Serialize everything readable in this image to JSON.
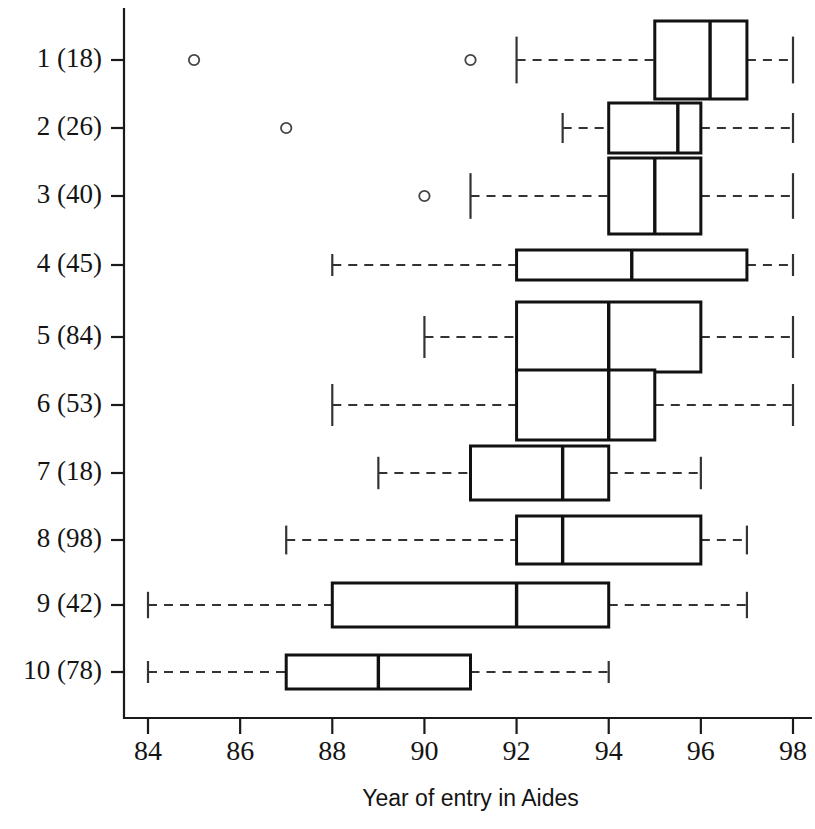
{
  "chart_data": {
    "type": "boxplot",
    "title": "",
    "xlabel": "Year of entry in Aides",
    "ylabel": "",
    "xlim": [
      83.3,
      98.6
    ],
    "xticks": [
      84,
      86,
      88,
      90,
      92,
      94,
      96,
      98
    ],
    "xtick_labels": [
      "84",
      "86",
      "88",
      "90",
      "92",
      "94",
      "96",
      "98"
    ],
    "grid": false,
    "legend": null,
    "orientation": "horizontal",
    "categories": [
      "1 (18)",
      "2 (26)",
      "3 (40)",
      "4 (45)",
      "5 (84)",
      "6 (53)",
      "7 (18)",
      "8 (98)",
      "9 (42)",
      "10 (78)"
    ],
    "boxes": [
      {
        "label": "1 (18)",
        "group": 1,
        "n": 18,
        "whisker_low": 92.0,
        "q1": 95.0,
        "median": 96.2,
        "q3": 97.0,
        "whisker_high": 98.0,
        "outliers": [
          85.0,
          91.0
        ]
      },
      {
        "label": "2 (26)",
        "group": 2,
        "n": 26,
        "whisker_low": 93.0,
        "q1": 94.0,
        "median": 95.5,
        "q3": 96.0,
        "whisker_high": 98.0,
        "outliers": [
          87.0
        ]
      },
      {
        "label": "3 (40)",
        "group": 3,
        "n": 40,
        "whisker_low": 91.0,
        "q1": 94.0,
        "median": 95.0,
        "q3": 96.0,
        "whisker_high": 98.0,
        "outliers": [
          90.0
        ]
      },
      {
        "label": "4 (45)",
        "group": 4,
        "n": 45,
        "whisker_low": 88.0,
        "q1": 92.0,
        "median": 94.5,
        "q3": 97.0,
        "whisker_high": 98.0,
        "outliers": []
      },
      {
        "label": "5 (84)",
        "group": 5,
        "n": 84,
        "whisker_low": 90.0,
        "q1": 92.0,
        "median": 94.0,
        "q3": 96.0,
        "whisker_high": 98.0,
        "outliers": []
      },
      {
        "label": "6 (53)",
        "group": 6,
        "n": 53,
        "whisker_low": 88.0,
        "q1": 92.0,
        "median": 94.0,
        "q3": 95.0,
        "whisker_high": 98.0,
        "outliers": []
      },
      {
        "label": "7 (18)",
        "group": 7,
        "n": 18,
        "whisker_low": 89.0,
        "q1": 91.0,
        "median": 93.0,
        "q3": 94.0,
        "whisker_high": 96.0,
        "outliers": []
      },
      {
        "label": "8 (98)",
        "group": 8,
        "n": 98,
        "whisker_low": 87.0,
        "q1": 92.0,
        "median": 93.0,
        "q3": 96.0,
        "whisker_high": 97.0,
        "outliers": []
      },
      {
        "label": "9 (42)",
        "group": 9,
        "n": 42,
        "whisker_low": 84.0,
        "q1": 88.0,
        "median": 92.0,
        "q3": 94.0,
        "whisker_high": 97.0,
        "outliers": []
      },
      {
        "label": "10 (78)",
        "group": 10,
        "n": 78,
        "whisker_low": 84.0,
        "q1": 87.0,
        "median": 89.0,
        "q3": 91.0,
        "whisker_high": 94.0,
        "outliers": []
      }
    ]
  },
  "layout": {
    "plot_left_px": 124,
    "plot_bottom_px": 718,
    "plot_top_px": 8,
    "plot_right_px": 812,
    "x_at_84_px": 148,
    "x_at_98_px": 793,
    "row_y_px": [
      60,
      128,
      196,
      265,
      337,
      405,
      473,
      540,
      605,
      672
    ],
    "box_heights_px": [
      78,
      50,
      76,
      30,
      70,
      70,
      54,
      48,
      44,
      34
    ],
    "xtick_label_y_px": 760,
    "xaxis_title_y_px": 806
  },
  "colors": {
    "axis": "#1a1a1a",
    "box_stroke": "#111111",
    "box_fill": "#ffffff",
    "whisker": "#333333",
    "outlier": "#444444",
    "background": "#ffffff",
    "text": "#141414"
  }
}
